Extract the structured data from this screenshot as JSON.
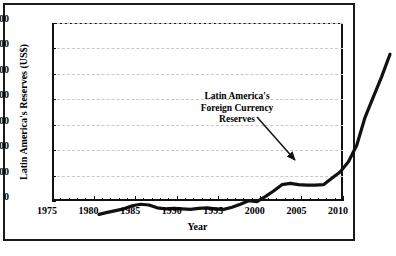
{
  "chart_data": {
    "type": "line",
    "title": "",
    "xlabel": "Year",
    "ylabel": "Latin America's Reserves (US$)",
    "xlim": [
      1975,
      2010
    ],
    "ylim": [
      0,
      700
    ],
    "ytick_step": 100,
    "xtick_step": 5,
    "xminor_step": 1,
    "grid": "horizontal-dashed",
    "legend": "none",
    "series_name": "Latin America's Foreign Currency Reserves",
    "x": [
      1975,
      1976,
      1977,
      1978,
      1979,
      1980,
      1981,
      1982,
      1983,
      1984,
      1985,
      1986,
      1987,
      1988,
      1989,
      1990,
      1991,
      1992,
      1993,
      1994,
      1995,
      1996,
      1997,
      1998,
      1999,
      2000,
      2001,
      2002,
      2003,
      2004,
      2005,
      2006,
      2007,
      2008,
      2009,
      2010
    ],
    "values": [
      18,
      26,
      33,
      40,
      52,
      58,
      55,
      44,
      40,
      42,
      40,
      38,
      42,
      44,
      40,
      38,
      46,
      58,
      72,
      68,
      88,
      110,
      135,
      140,
      135,
      133,
      133,
      135,
      160,
      185,
      225,
      290,
      400,
      480,
      560,
      648
    ],
    "annotations": [
      {
        "text_lines": [
          "Latin America's",
          "Foreign Currency",
          "Reserves"
        ],
        "arrow_from": {
          "x": 252,
          "y": 112
        },
        "arrow_to": {
          "x": 290,
          "y": 155
        }
      }
    ],
    "ytick_labels": [
      "0",
      "100",
      "200",
      "300",
      "400",
      "500",
      "600",
      "700"
    ],
    "xtick_labels": [
      "1975",
      "1980",
      "1985",
      "1990",
      "1995",
      "2000",
      "2005",
      "2010"
    ]
  },
  "style": {
    "line_color": "#111111",
    "grid_color": "#c9c9c9",
    "axis_color": "#111111",
    "background": "#ffffff",
    "frame_color": "#1a1a1a"
  }
}
